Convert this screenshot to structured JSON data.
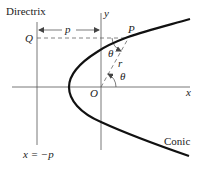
{
  "diagram": {
    "labels": {
      "directrix": "Directrix",
      "y_axis": "y",
      "x_axis": "x",
      "origin": "O",
      "point_p": "P",
      "point_q": "Q",
      "distance_p": "p",
      "radius": "r",
      "angle_top": "θ",
      "angle_bottom": "θ",
      "directrix_eq": "x = −p",
      "conic": "Conic"
    },
    "colors": {
      "curve": "#111111",
      "axis": "#555555",
      "dashed": "#666666",
      "text": "#222222"
    }
  }
}
